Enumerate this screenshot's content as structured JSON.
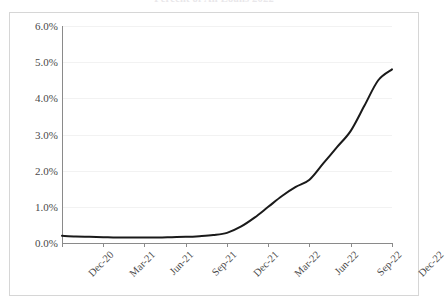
{
  "chart_data": {
    "type": "line",
    "title": "Percent of All Loans 2022",
    "xlabel": "",
    "ylabel": "",
    "ylim": [
      0.0,
      6.0
    ],
    "ytick_labels": [
      "6.0%",
      "5.0%",
      "4.0%",
      "3.0%",
      "2.0%",
      "1.0%",
      "0.0%"
    ],
    "ytick_values": [
      6.0,
      5.0,
      4.0,
      3.0,
      2.0,
      1.0,
      0.0
    ],
    "ytick_interval": 1.0,
    "xtick_labels": [
      "Dec-20",
      "Mar-21",
      "Jun-21",
      "Sep-21",
      "Dec-21",
      "Mar-22",
      "Jun-22",
      "Sep-22",
      "Dec-22"
    ],
    "xtick_rotation_deg": -45,
    "grid": "horizontal",
    "legend": "none",
    "line_color": "#1a1a1a",
    "x": [
      "Dec-20",
      "Jan-21",
      "Feb-21",
      "Mar-21",
      "Apr-21",
      "May-21",
      "Jun-21",
      "Jul-21",
      "Aug-21",
      "Sep-21",
      "Oct-21",
      "Nov-21",
      "Dec-21",
      "Jan-22",
      "Feb-22",
      "Mar-22",
      "Apr-22",
      "May-22",
      "Jun-22",
      "Jul-22",
      "Aug-22",
      "Sep-22",
      "Oct-22",
      "Nov-22",
      "Dec-22"
    ],
    "values": [
      0.2,
      0.18,
      0.17,
      0.16,
      0.15,
      0.15,
      0.15,
      0.15,
      0.16,
      0.17,
      0.19,
      0.22,
      0.28,
      0.45,
      0.7,
      1.0,
      1.3,
      1.55,
      1.75,
      2.2,
      2.65,
      3.1,
      3.8,
      4.5,
      4.8
    ],
    "units": "percent"
  }
}
